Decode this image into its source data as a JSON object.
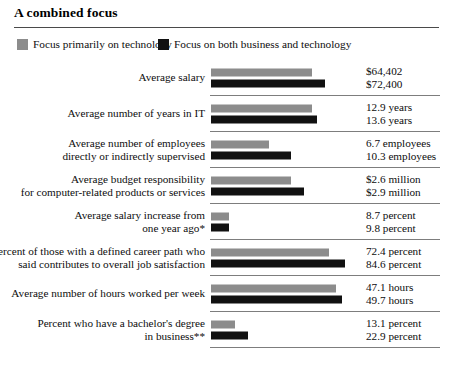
{
  "title": "A combined focus",
  "legend": [
    {
      "key": "gray",
      "label": "Focus primarily on technology",
      "color": "#8c8c8c",
      "swatch_name": "legend-swatch-gray"
    },
    {
      "key": "black",
      "label": "Focus on both business and technology",
      "color": "#111111",
      "swatch_name": "legend-swatch-black"
    }
  ],
  "rows": [
    {
      "label": "Average salary",
      "gray_value_label": "$64,402",
      "black_value_label": "$72,400",
      "gray_bar_pct": 63,
      "black_bar_pct": 71
    },
    {
      "label": "Average number of years in IT",
      "gray_value_label": "12.9 years",
      "black_value_label": "13.6 years",
      "gray_bar_pct": 63,
      "black_bar_pct": 66
    },
    {
      "label": "Average number of employees\ndirectly or indirectly supervised",
      "gray_value_label": "6.7 employees",
      "black_value_label": "10.3 employees",
      "gray_bar_pct": 36,
      "black_bar_pct": 50
    },
    {
      "label": "Average budget responsibility\nfor computer-related products or services",
      "gray_value_label": "$2.6 million",
      "black_value_label": "$2.9 million",
      "gray_bar_pct": 50,
      "black_bar_pct": 58
    },
    {
      "label": "Average salary increase from\none year ago*",
      "gray_value_label": "8.7 percent",
      "black_value_label": "9.8 percent",
      "gray_bar_pct": 11,
      "black_bar_pct": 11
    },
    {
      "label": "Percent of those with a defined career path who\nsaid contributes to overall job satisfaction",
      "gray_value_label": "72.4 percent",
      "black_value_label": "84.6 percent",
      "gray_bar_pct": 74,
      "black_bar_pct": 84
    },
    {
      "label": "Average number of hours worked per week",
      "gray_value_label": "47.1 hours",
      "black_value_label": "49.7 hours",
      "gray_bar_pct": 78,
      "black_bar_pct": 82
    },
    {
      "label": "Percent who have a bachelor's degree\nin business**",
      "gray_value_label": "13.1 percent",
      "black_value_label": "22.9 percent",
      "gray_bar_pct": 15,
      "black_bar_pct": 23
    }
  ],
  "chart_data": {
    "type": "bar",
    "title": "A combined focus",
    "xlabel": "",
    "ylabel": "",
    "orientation": "horizontal",
    "grid": false,
    "legend_position": "top-left",
    "categories": [
      "Average salary",
      "Average number of years in IT",
      "Average number of employees directly or indirectly supervised",
      "Average budget responsibility for computer-related products or services",
      "Average salary increase from one year ago*",
      "Percent of those with a defined career path who said contributes to overall job satisfaction",
      "Average number of hours worked per week",
      "Percent who have a bachelor's degree in business**"
    ],
    "series": [
      {
        "name": "Focus primarily on technology",
        "color": "#8c8c8c",
        "values": [
          64402,
          12.9,
          6.7,
          2.6,
          8.7,
          72.4,
          47.1,
          13.1
        ],
        "value_labels": [
          "$64,402",
          "12.9 years",
          "6.7 employees",
          "$2.6 million",
          "8.7 percent",
          "72.4 percent",
          "47.1 hours",
          "13.1 percent"
        ]
      },
      {
        "name": "Focus on both business and technology",
        "color": "#111111",
        "values": [
          72400,
          13.6,
          10.3,
          2.9,
          9.8,
          84.6,
          49.7,
          22.9
        ],
        "value_labels": [
          "$72,400",
          "13.6 years",
          "10.3 employees",
          "$2.9 million",
          "9.8 percent",
          "84.6 percent",
          "49.7 hours",
          "22.9 percent"
        ]
      }
    ],
    "units": [
      "dollars",
      "years",
      "employees",
      "million dollars",
      "percent",
      "percent",
      "hours",
      "percent"
    ]
  }
}
